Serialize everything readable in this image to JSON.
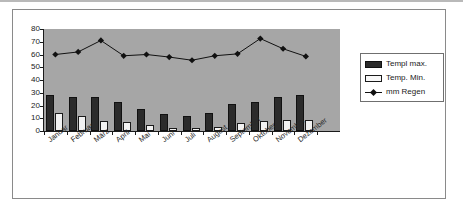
{
  "chart_data": {
    "type": "bar",
    "title": "",
    "subtitle": "",
    "xlabel": "",
    "ylabel": "",
    "ylim": [
      0,
      80
    ],
    "yticks": [
      0,
      10,
      20,
      30,
      40,
      50,
      60,
      70,
      80
    ],
    "grid": false,
    "legend_position": "right",
    "plot_background": "#a6a6a6",
    "categories": [
      "Januar",
      "Februar",
      "März",
      "April",
      "Mai",
      "Juni",
      "Juli",
      "August",
      "September",
      "Oktober",
      "November",
      "Dezember"
    ],
    "series": [
      {
        "name": "Templ max.",
        "type": "bar",
        "color": "#2b2b2b",
        "values": [
          28,
          27,
          27,
          23,
          17.5,
          13,
          11.5,
          14,
          21,
          22.5,
          26.5,
          28.5
        ]
      },
      {
        "name": "Temp. Min.",
        "type": "bar",
        "color": "#f2f2f2",
        "values": [
          14,
          12,
          7.5,
          7,
          5,
          2.5,
          2,
          3.5,
          6,
          8,
          9,
          9
        ]
      },
      {
        "name": "mm Regen",
        "type": "line",
        "color": "#111111",
        "marker": "diamond",
        "values": [
          60,
          62,
          71,
          59,
          60,
          58,
          55.5,
          59,
          60.5,
          72.5,
          64.5,
          58.5
        ]
      }
    ]
  },
  "legend": {
    "entries": [
      {
        "label": "Templ max.",
        "key": "swatch-filled-dark"
      },
      {
        "label": "Temp. Min.",
        "key": "swatch-outline-light"
      },
      {
        "label": "mm Regen",
        "key": "line-with-diamond-marker"
      }
    ]
  }
}
